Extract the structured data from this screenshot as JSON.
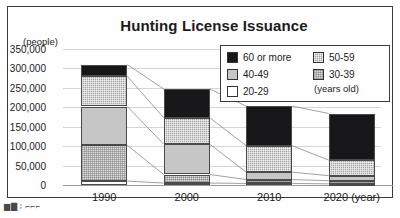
{
  "chart_data": {
    "type": "bar",
    "subtype": "stacked-bar-with-connectors",
    "title": "Hunting License Issuance",
    "xlabel": "(year)",
    "ylabel": "(people)",
    "categories": [
      "1990",
      "2000",
      "2010",
      "2020"
    ],
    "series": [
      {
        "name": "20-29",
        "values": [
          10000,
          5000,
          4000,
          3000
        ]
      },
      {
        "name": "30-39",
        "values": [
          92000,
          22000,
          10000,
          8000
        ]
      },
      {
        "name": "40-49",
        "values": [
          100000,
          78000,
          19000,
          13000
        ]
      },
      {
        "name": "50-59",
        "values": [
          78000,
          68000,
          68000,
          40000
        ]
      },
      {
        "name": "60 or more",
        "values": [
          30000,
          74000,
          102000,
          120000
        ]
      }
    ],
    "totals": [
      310000,
      247000,
      203000,
      184000
    ],
    "ylim": [
      0,
      350000
    ],
    "ytick_values": [
      0,
      50000,
      100000,
      150000,
      200000,
      250000,
      300000,
      350000
    ],
    "ytick_labels": [
      "0",
      "50,000",
      "100,000",
      "150,000",
      "200,000",
      "250,000",
      "300,000",
      "350,000"
    ],
    "grid": true,
    "legend_position": "top-right",
    "legend_note": "(years old)"
  },
  "legend": {
    "left_column": [
      {
        "label": "60 or more",
        "key": "60 or more",
        "swatch": "solid-black"
      },
      {
        "label": "40-49",
        "key": "40-49",
        "swatch": "solid-gray"
      },
      {
        "label": "20-29",
        "key": "20-29",
        "swatch": "white"
      }
    ],
    "right_column": [
      {
        "label": "50-59",
        "key": "50-59",
        "swatch": "dark-checker"
      },
      {
        "label": "30-39",
        "key": "30-39",
        "swatch": "light-checker"
      }
    ],
    "note": "(years old)"
  },
  "axes": {
    "y_unit_label": "(people)",
    "x_unit_label": "(year)"
  },
  "colors": {
    "age_60_plus": "#17171a",
    "age_50_59": "#a6a6a6",
    "age_40_49": "#c6c6c6",
    "age_30_39": "#dcdcdc",
    "age_20_29": "#ffffff",
    "grid": "#d6d6d6",
    "axis": "#9a9a9a",
    "frame": "#3a3a3a",
    "text": "#1c1c1c"
  },
  "artifact": {
    "bottom_text": "▆▇ ⁞ ⌐⌐⌐"
  }
}
